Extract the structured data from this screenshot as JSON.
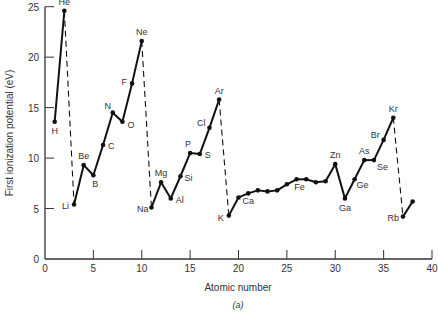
{
  "chart_data": {
    "type": "line",
    "title": "",
    "xlabel": "Atomic number",
    "ylabel": "First ionization potential (eV)",
    "caption": "(a)",
    "xlim": [
      0,
      40
    ],
    "ylim": [
      0,
      25
    ],
    "xticks": [
      0,
      5,
      10,
      15,
      20,
      25,
      30,
      35,
      40
    ],
    "yticks": [
      0,
      5,
      10,
      15,
      20,
      25
    ],
    "grid": false,
    "legend": "none",
    "x": [
      1,
      2,
      3,
      4,
      5,
      6,
      7,
      8,
      9,
      10,
      11,
      12,
      13,
      14,
      15,
      16,
      17,
      18,
      19,
      20,
      21,
      22,
      23,
      24,
      25,
      26,
      27,
      28,
      29,
      30,
      31,
      32,
      33,
      34,
      35,
      36,
      37,
      38
    ],
    "values": [
      13.6,
      24.6,
      5.4,
      9.3,
      8.3,
      11.3,
      14.5,
      13.6,
      17.4,
      21.6,
      5.1,
      7.6,
      6.0,
      8.2,
      10.5,
      10.4,
      13.0,
      15.8,
      4.3,
      6.1,
      6.5,
      6.8,
      6.7,
      6.8,
      7.4,
      7.9,
      7.9,
      7.6,
      7.7,
      9.4,
      6.0,
      7.9,
      9.8,
      9.8,
      11.8,
      14.0,
      4.2,
      5.7
    ],
    "labels": {
      "1": "H",
      "2": "He",
      "3": "Li",
      "4": "Be",
      "5": "B",
      "6": "C",
      "7": "N",
      "8": "O",
      "9": "F",
      "10": "Ne",
      "11": "Na",
      "12": "Mg",
      "13": "Al",
      "14": "Si",
      "15": "P",
      "16": "S",
      "17": "Cl",
      "18": "Ar",
      "19": "K",
      "20": "Ca",
      "26": "Fe",
      "30": "Zn",
      "31": "Ga",
      "32": "Ge",
      "33": "As",
      "34": "Se",
      "35": "Br",
      "36": "Kr",
      "37": "Rb"
    },
    "dashed_transitions": [
      [
        2,
        3
      ],
      [
        10,
        11
      ],
      [
        18,
        19
      ],
      [
        36,
        37
      ]
    ]
  }
}
